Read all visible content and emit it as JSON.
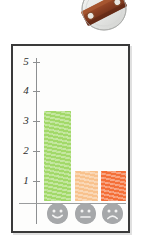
{
  "scene": {
    "background_color": "#ffffff",
    "objects": [
      {
        "name": "pencil-sharpener",
        "label": "pencil sharpener",
        "body_color": "#8a3f22",
        "base_color": "#e8e8e6"
      }
    ]
  },
  "chart_card": {
    "frame_color": "#3a3a3a",
    "paper_color": "#fdfdfc"
  },
  "chart_data": {
    "type": "bar",
    "title": "",
    "subtitle": "",
    "xlabel": "",
    "ylabel": "",
    "categories": [
      "happy-face",
      "neutral-face",
      "sad-face"
    ],
    "category_labels": [
      "☺",
      "☹",
      "☹"
    ],
    "values": [
      3,
      1,
      1
    ],
    "ylim": [
      0,
      5
    ],
    "ytick_labels": [
      "1",
      "2",
      "3",
      "4",
      "5"
    ],
    "ytick_values": [
      1,
      2,
      3,
      4,
      5
    ],
    "grid": false,
    "legend": "none",
    "bar_colors": [
      "#9ed862",
      "#f8b87a",
      "#f4682e"
    ],
    "style": "hand-drawn crayon"
  },
  "axis": {
    "line_color": "#8d8f91",
    "tick_color": "#8d8f91",
    "label_color": "#2e2e2e"
  },
  "faces": [
    {
      "name": "happy-face",
      "mood": "happy",
      "color": "#a6a8aa"
    },
    {
      "name": "neutral-face",
      "mood": "neutral",
      "color": "#a6a8aa"
    },
    {
      "name": "sad-face",
      "mood": "sad",
      "color": "#a6a8aa"
    }
  ]
}
